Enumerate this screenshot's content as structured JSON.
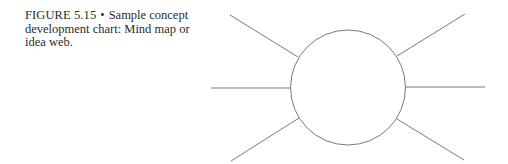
{
  "caption": {
    "figure_label": "FIGURE 5.15",
    "separator": "•",
    "text": "Sample concept development chart: Mind map or idea web."
  },
  "diagram": {
    "type": "mind-map",
    "stroke_color": "#7a7a7a",
    "center_node": {
      "cx": 348,
      "cy": 87.5,
      "r": 57.5,
      "label": ""
    },
    "branches": [
      {
        "name": "top-left",
        "x1": 298,
        "y1": 57,
        "x2": 230,
        "y2": 15
      },
      {
        "name": "left",
        "x1": 291,
        "y1": 88,
        "x2": 211,
        "y2": 88
      },
      {
        "name": "bottom-left",
        "x1": 299,
        "y1": 118,
        "x2": 231,
        "y2": 161
      },
      {
        "name": "top-right",
        "x1": 397,
        "y1": 56,
        "x2": 465,
        "y2": 14
      },
      {
        "name": "right",
        "x1": 405,
        "y1": 87,
        "x2": 485,
        "y2": 87
      },
      {
        "name": "bottom-right",
        "x1": 397,
        "y1": 119,
        "x2": 464,
        "y2": 160
      }
    ]
  }
}
